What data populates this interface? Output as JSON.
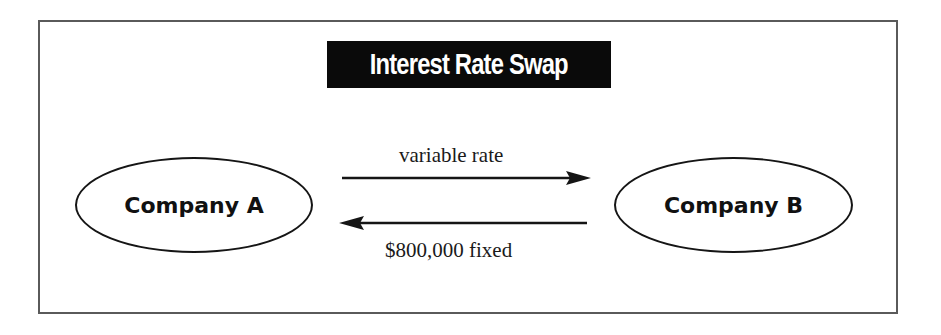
{
  "diagram": {
    "title": "Interest Rate Swap",
    "nodes": [
      {
        "id": "company-a",
        "label": "Company A"
      },
      {
        "id": "company-b",
        "label": "Company B"
      }
    ],
    "edges": [
      {
        "from": "company-a",
        "to": "company-b",
        "label": "variable rate"
      },
      {
        "from": "company-b",
        "to": "company-a",
        "label": "$800,000 fixed"
      }
    ],
    "colors": {
      "title_bg": "#0a0a0a",
      "title_text": "#ffffff",
      "stroke": "#151515",
      "frame": "#5a5a5a"
    }
  }
}
